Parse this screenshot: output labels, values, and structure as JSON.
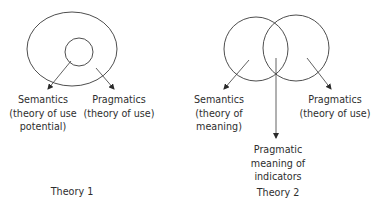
{
  "theory1": {
    "caption": "Theory 1",
    "shapes": {
      "outer_ellipse": "Pragmatics domain",
      "inner_circle": "Semantics domain"
    },
    "labels": {
      "semantics": {
        "line1": "Semantics",
        "line2": "(theory of use",
        "line3": "potential)"
      },
      "pragmatics": {
        "line1": "Pragmatics",
        "line2": "(theory of use)"
      }
    }
  },
  "theory2": {
    "caption": "Theory 2",
    "shapes": {
      "left_circle": "Semantics domain",
      "right_circle": "Pragmatics domain",
      "overlap": "Pragmatic meaning of indicators"
    },
    "labels": {
      "semantics": {
        "line1": "Semantics",
        "line2": "(theory of",
        "line3": "meaning)"
      },
      "pragmatics": {
        "line1": "Pragmatics",
        "line2": "(theory of use)"
      },
      "overlap": {
        "line1": "Pragmatic",
        "line2": "meaning of",
        "line3": "indicators"
      }
    }
  },
  "colors": {
    "stroke": "#3a3a3a",
    "text": "#2e2e2e",
    "background": "#ffffff"
  }
}
